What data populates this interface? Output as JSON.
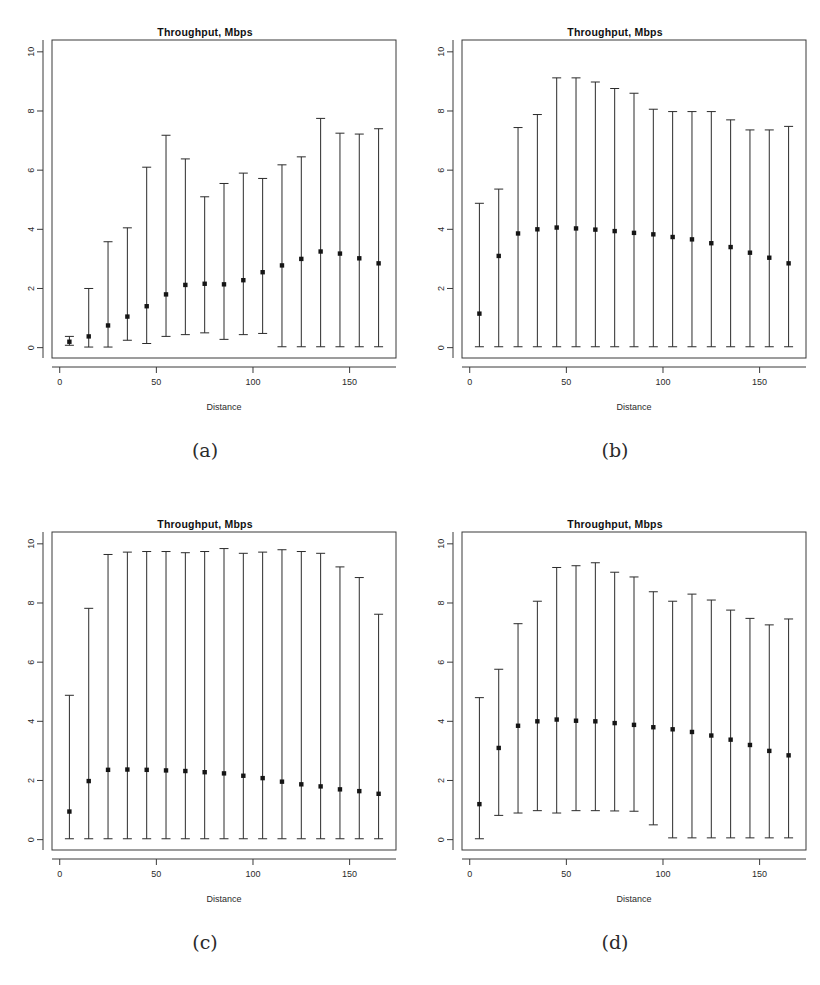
{
  "figure": {
    "width": 820,
    "height": 985,
    "background": "#ffffff",
    "ink": "#1a1a1a",
    "panel_count": 4
  },
  "common": {
    "title": "Throughput, Mbps",
    "xlabel": "Distance",
    "ylabel": "",
    "x_ticks": [
      0,
      50,
      100,
      150
    ],
    "y_ticks": [
      0,
      2,
      4,
      6,
      8,
      10
    ],
    "xlim": [
      -4,
      174
    ],
    "ylim": [
      -0.35,
      10.4
    ],
    "x_values": [
      5,
      15,
      25,
      35,
      45,
      55,
      65,
      75,
      85,
      95,
      105,
      115,
      125,
      135,
      145,
      155,
      165
    ],
    "marker": "square",
    "grid": false,
    "legend": "none"
  },
  "panels": [
    {
      "id": "a",
      "caption": "(a)",
      "title": "Throughput, Mbps",
      "xlabel": "Distance",
      "chart_data": {
        "type": "scatter",
        "title": "Throughput, Mbps",
        "xlabel": "Distance",
        "ylabel": "",
        "xlim": [
          -4,
          174
        ],
        "ylim": [
          -0.35,
          10.4
        ],
        "grid": false,
        "x": [
          5,
          15,
          25,
          35,
          45,
          55,
          65,
          75,
          85,
          95,
          105,
          115,
          125,
          135,
          145,
          155,
          165
        ],
        "mean": [
          0.2,
          0.38,
          0.75,
          1.05,
          1.4,
          1.8,
          2.12,
          2.16,
          2.14,
          2.28,
          2.55,
          2.78,
          3.0,
          3.25,
          3.18,
          3.02,
          2.85
        ],
        "lower": [
          0.08,
          0.02,
          0.02,
          0.25,
          0.14,
          0.38,
          0.44,
          0.5,
          0.28,
          0.44,
          0.48,
          0.03,
          0.03,
          0.03,
          0.03,
          0.03,
          0.03
        ],
        "upper": [
          0.38,
          2.0,
          3.58,
          4.05,
          6.1,
          7.18,
          6.38,
          5.1,
          5.55,
          5.9,
          5.72,
          6.18,
          6.45,
          7.75,
          7.25,
          7.22,
          7.4
        ]
      }
    },
    {
      "id": "b",
      "caption": "(b)",
      "title": "Throughput, Mbps",
      "xlabel": "Distance",
      "chart_data": {
        "type": "scatter",
        "title": "Throughput, Mbps",
        "xlabel": "Distance",
        "ylabel": "",
        "xlim": [
          -4,
          174
        ],
        "ylim": [
          -0.35,
          10.4
        ],
        "grid": false,
        "x": [
          5,
          15,
          25,
          35,
          45,
          55,
          65,
          75,
          85,
          95,
          105,
          115,
          125,
          135,
          145,
          155,
          165
        ],
        "mean": [
          1.15,
          3.1,
          3.86,
          4.0,
          4.06,
          4.03,
          3.99,
          3.94,
          3.88,
          3.83,
          3.74,
          3.66,
          3.53,
          3.4,
          3.21,
          3.04,
          2.85
        ],
        "lower": [
          0.03,
          0.03,
          0.03,
          0.03,
          0.03,
          0.03,
          0.03,
          0.03,
          0.03,
          0.03,
          0.03,
          0.03,
          0.03,
          0.03,
          0.03,
          0.03,
          0.03
        ],
        "upper": [
          4.88,
          5.36,
          7.44,
          7.88,
          9.12,
          9.12,
          8.98,
          8.76,
          8.6,
          8.06,
          7.98,
          7.98,
          7.98,
          7.7,
          7.36,
          7.36,
          7.48
        ]
      }
    },
    {
      "id": "c",
      "caption": "(c)",
      "title": "Throughput, Mbps",
      "xlabel": "Distance",
      "chart_data": {
        "type": "scatter",
        "title": "Throughput, Mbps",
        "xlabel": "Distance",
        "ylabel": "",
        "xlim": [
          -4,
          174
        ],
        "ylim": [
          -0.35,
          10.4
        ],
        "grid": false,
        "x": [
          5,
          15,
          25,
          35,
          45,
          55,
          65,
          75,
          85,
          95,
          105,
          115,
          125,
          135,
          145,
          155,
          165
        ],
        "mean": [
          0.95,
          1.98,
          2.36,
          2.37,
          2.36,
          2.34,
          2.32,
          2.28,
          2.24,
          2.16,
          2.08,
          1.96,
          1.87,
          1.8,
          1.7,
          1.64,
          1.55
        ],
        "lower": [
          0.03,
          0.03,
          0.03,
          0.03,
          0.03,
          0.03,
          0.03,
          0.03,
          0.03,
          0.03,
          0.03,
          0.03,
          0.03,
          0.03,
          0.03,
          0.03,
          0.03
        ],
        "upper": [
          4.88,
          7.82,
          9.64,
          9.72,
          9.74,
          9.74,
          9.7,
          9.74,
          9.84,
          9.68,
          9.72,
          9.8,
          9.74,
          9.68,
          9.22,
          8.86,
          7.62
        ]
      }
    },
    {
      "id": "d",
      "caption": "(d)",
      "title": "Throughput, Mbps",
      "xlabel": "Distance",
      "chart_data": {
        "type": "scatter",
        "title": "Throughput, Mbps",
        "xlabel": "Distance",
        "ylabel": "",
        "xlim": [
          -4,
          174
        ],
        "ylim": [
          -0.35,
          10.4
        ],
        "grid": false,
        "x": [
          5,
          15,
          25,
          35,
          45,
          55,
          65,
          75,
          85,
          95,
          105,
          115,
          125,
          135,
          145,
          155,
          165
        ],
        "mean": [
          1.2,
          3.1,
          3.85,
          4.0,
          4.06,
          4.02,
          4.0,
          3.94,
          3.88,
          3.8,
          3.73,
          3.64,
          3.52,
          3.38,
          3.2,
          3.0,
          2.85
        ],
        "lower": [
          0.03,
          0.82,
          0.9,
          0.98,
          0.9,
          0.98,
          0.98,
          0.97,
          0.96,
          0.5,
          0.06,
          0.06,
          0.06,
          0.06,
          0.06,
          0.06,
          0.06
        ],
        "upper": [
          4.8,
          5.76,
          7.3,
          8.06,
          9.2,
          9.26,
          9.36,
          9.04,
          8.88,
          8.38,
          8.06,
          8.3,
          8.1,
          7.76,
          7.48,
          7.26,
          7.46
        ]
      }
    }
  ]
}
